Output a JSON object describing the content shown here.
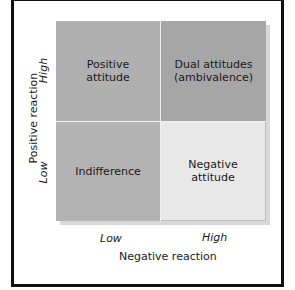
{
  "diagram": {
    "type": "2x2 matrix",
    "colors": {
      "positive_attitude": "#b0b0b0",
      "dual_attitudes": "#a6a6a6",
      "indifference": "#b3b3b3",
      "negative_attitude": "#e8e8e8",
      "frame_border": "#111111",
      "divider": "#f2f2f2"
    },
    "quadrants": {
      "top_left": {
        "line1": "Positive",
        "line2": "attitude"
      },
      "top_right": {
        "line1": "Dual attitudes",
        "line2": "(ambivalence)"
      },
      "bottom_left": {
        "line1": "Indifference",
        "line2": ""
      },
      "bottom_right": {
        "line1": "Negative",
        "line2": "attitude"
      }
    },
    "y_axis": {
      "label": "Positive reaction",
      "tick_high": "High",
      "tick_low": "Low"
    },
    "x_axis": {
      "label": "Negative reaction",
      "tick_low": "Low",
      "tick_high": "High"
    }
  }
}
